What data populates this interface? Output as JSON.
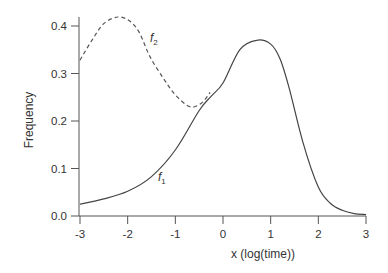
{
  "chart_data": {
    "type": "line",
    "title": "",
    "xlabel": "x (log(time))",
    "ylabel": "Frequency",
    "xlim": [
      -3,
      3
    ],
    "ylim": [
      0,
      0.42
    ],
    "grid": false,
    "legend": "none (inline curve labels)",
    "x_ticks": [
      "-3",
      "-2",
      "-1",
      "0",
      "1",
      "2",
      "3"
    ],
    "y_ticks": [
      "0.0",
      "0.1",
      "0.2",
      "0.3",
      "0.4"
    ],
    "series": [
      {
        "name": "f1",
        "label_main": "f",
        "label_sub": "1",
        "style": "solid",
        "x": [
          -3,
          -2.5,
          -2,
          -1.5,
          -1,
          -0.5,
          -0.25,
          0,
          0.35,
          0.7,
          1.0,
          1.2,
          1.4,
          1.68,
          2.0,
          2.25,
          2.5,
          2.75,
          3.0
        ],
        "y": [
          0.025,
          0.036,
          0.052,
          0.083,
          0.139,
          0.222,
          0.252,
          0.28,
          0.35,
          0.37,
          0.362,
          0.33,
          0.265,
          0.154,
          0.061,
          0.027,
          0.012,
          0.005,
          0.003
        ]
      },
      {
        "name": "f2",
        "label_main": "f",
        "label_sub": "2",
        "style": "dashed",
        "x": [
          -3,
          -2.75,
          -2.5,
          -2.2,
          -1.95,
          -1.75,
          -1.53,
          -1.25,
          -1.0,
          -0.69,
          -0.45,
          -0.27
        ],
        "y": [
          0.328,
          0.37,
          0.405,
          0.419,
          0.41,
          0.385,
          0.335,
          0.29,
          0.255,
          0.23,
          0.238,
          0.26
        ]
      }
    ],
    "annotations": [
      {
        "text": "f2",
        "x": -1.55,
        "y": 0.375
      },
      {
        "text": "f1",
        "x": -1.32,
        "y": 0.08
      }
    ]
  },
  "labels": {
    "xlabel": "x (log(time))",
    "ylabel": "Frequency",
    "f1_main": "f",
    "f1_sub": "1",
    "f2_main": "f",
    "f2_sub": "2"
  }
}
